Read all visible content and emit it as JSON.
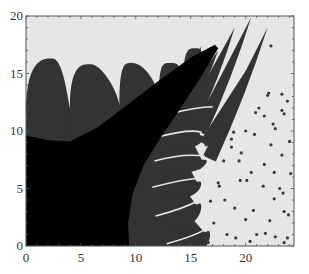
{
  "chart_data": {
    "type": "heatmap",
    "title": "",
    "xlabel": "",
    "ylabel": "",
    "xlim": [
      0,
      24.4
    ],
    "ylim": [
      0,
      20
    ],
    "xticks": [
      0,
      5,
      10,
      15,
      20
    ],
    "yticks": [
      0,
      5,
      10,
      15,
      20
    ],
    "xtick_labels": [
      "0",
      "5",
      "10",
      "15",
      "20"
    ],
    "ytick_labels": [
      "0",
      "5",
      "10",
      "15",
      "20"
    ],
    "grid": false,
    "legend": "none",
    "colors": {
      "background_region": "#e6e6e6",
      "dark_region": "#333333",
      "core_region": "#000000",
      "dots": "#3a3a3a",
      "axes": "#555555"
    },
    "regions": [
      {
        "name": "dark-basin",
        "description": "grey basin with finger-like fronds along its upper-right boundary",
        "fingers_top": [
          {
            "base": [
              0.0,
              11.5
            ],
            "tip": [
              2.4,
              16.3
            ],
            "end": [
              4.0,
              12.0
            ]
          },
          {
            "base": [
              4.0,
              12.0
            ],
            "tip": [
              5.9,
              15.8
            ],
            "end": [
              8.5,
              12.3
            ]
          },
          {
            "base": [
              8.5,
              12.3
            ],
            "tip": [
              9.7,
              15.9
            ],
            "end": [
              12.1,
              13.0
            ]
          },
          {
            "base": [
              12.1,
              13.0
            ],
            "tip": [
              13.2,
              15.9
            ],
            "end": [
              14.3,
              14.0
            ]
          },
          {
            "base": [
              14.3,
              14.0
            ],
            "tip": [
              15.5,
              17.2
            ],
            "end": [
              16.0,
              15.0
            ]
          }
        ],
        "fingers_diagonal": [
          {
            "base": [
              12.0,
              13.3
            ],
            "tip": [
              14.5,
              15.9
            ]
          },
          {
            "base": [
              13.0,
              12.5
            ],
            "tip": [
              16.0,
              17.4
            ]
          },
          {
            "base": [
              14.2,
              11.7
            ],
            "tip": [
              17.5,
              17.0
            ]
          },
          {
            "base": [
              15.0,
              10.8
            ],
            "tip": [
              19.0,
              19.0
            ]
          },
          {
            "base": [
              15.8,
              9.9
            ],
            "tip": [
              20.5,
              19.9
            ]
          },
          {
            "base": [
              16.4,
              8.8
            ],
            "tip": [
              21.0,
              16.7
            ]
          },
          {
            "base": [
              16.7,
              7.6
            ],
            "tip": [
              22.0,
              19.0
            ]
          }
        ],
        "fingers_right": [
          {
            "base": [
              14.0,
              0.0
            ],
            "tip": [
              16.6,
              1.3
            ]
          },
          {
            "base": [
              13.0,
              2.4
            ],
            "tip": [
              15.8,
              3.7
            ]
          },
          {
            "base": [
              12.7,
              4.9
            ],
            "tip": [
              15.8,
              5.6
            ]
          },
          {
            "base": [
              12.9,
              7.2
            ],
            "tip": [
              16.3,
              7.5
            ]
          },
          {
            "base": [
              13.3,
              9.3
            ],
            "tip": [
              16.0,
              9.6
            ]
          },
          {
            "base": [
              14.0,
              11.2
            ],
            "tip": [
              17.0,
              11.8
            ]
          }
        ]
      },
      {
        "name": "black-core",
        "description": "black central basin with a narrow wedge extending toward (17.5, 17.3)",
        "boundary": [
          [
            0,
            0
          ],
          [
            9.4,
            0
          ],
          [
            9.3,
            2.0
          ],
          [
            9.7,
            4.5
          ],
          [
            10.7,
            7.0
          ],
          [
            12.1,
            9.2
          ],
          [
            13.8,
            11.6
          ],
          [
            15.8,
            14.5
          ],
          [
            17.5,
            17.2
          ],
          [
            17.2,
            17.5
          ],
          [
            15.0,
            16.4
          ],
          [
            12.0,
            14.3
          ],
          [
            9.0,
            12.1
          ],
          [
            6.5,
            10.3
          ],
          [
            4.0,
            9.1
          ],
          [
            2.0,
            9.2
          ],
          [
            0,
            9.6
          ]
        ]
      }
    ],
    "points": [
      [
        22.3,
        17.4
      ],
      [
        19.6,
        13.8
      ],
      [
        22.0,
        13.1
      ],
      [
        22.1,
        13.3
      ],
      [
        18.8,
        12.4
      ],
      [
        21.2,
        12.0
      ],
      [
        20.9,
        11.6
      ],
      [
        21.7,
        11.3
      ],
      [
        23.5,
        11.5
      ],
      [
        23.3,
        11.8
      ],
      [
        18.2,
        11.0
      ],
      [
        22.5,
        10.6
      ],
      [
        20.0,
        10.0
      ],
      [
        22.7,
        10.2
      ],
      [
        20.8,
        9.7
      ],
      [
        22.3,
        8.8
      ],
      [
        18.7,
        8.6
      ],
      [
        19.6,
        8.1
      ],
      [
        23.3,
        7.9
      ],
      [
        21.7,
        7.1
      ],
      [
        23.8,
        12.6
      ],
      [
        22.6,
        6.4
      ],
      [
        23.3,
        13.2
      ],
      [
        19.4,
        7.4
      ],
      [
        20.5,
        6.4
      ],
      [
        18.7,
        9.3
      ],
      [
        16.6,
        10.8
      ],
      [
        17.3,
        9.2
      ],
      [
        20.1,
        5.7
      ],
      [
        21.6,
        5.2
      ],
      [
        23.1,
        5.0
      ],
      [
        22.6,
        4.1
      ],
      [
        23.4,
        4.6
      ],
      [
        19.0,
        3.3
      ],
      [
        23.5,
        3.0
      ],
      [
        23.9,
        2.7
      ],
      [
        17.5,
        5.5
      ],
      [
        19.5,
        5.7
      ],
      [
        22.2,
        2.2
      ],
      [
        21.8,
        1.1
      ],
      [
        18.3,
        1.0
      ],
      [
        19.1,
        0.7
      ],
      [
        20.4,
        0.4
      ],
      [
        21.0,
        1.0
      ],
      [
        23.5,
        0.3
      ],
      [
        23.8,
        0.7
      ],
      [
        16.6,
        0.3
      ],
      [
        17.6,
        5.2
      ],
      [
        18.0,
        7.4
      ],
      [
        18.9,
        9.9
      ],
      [
        16.8,
        3.9
      ],
      [
        17.1,
        2.0
      ],
      [
        15.8,
        6.8
      ],
      [
        18.1,
        4.0
      ],
      [
        20.7,
        3.1
      ],
      [
        16.4,
        8.8
      ],
      [
        22.7,
        0.8
      ],
      [
        20.0,
        2.3
      ],
      [
        24.1,
        6.3
      ],
      [
        24.0,
        9.1
      ]
    ]
  }
}
